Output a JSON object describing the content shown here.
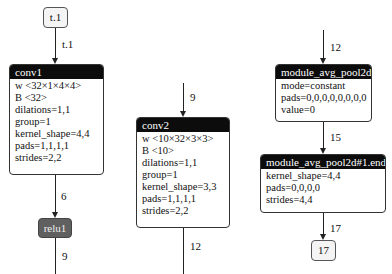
{
  "graph": {
    "inputs": [
      {
        "label": "t.1"
      }
    ],
    "outputs": [
      {
        "label": "17"
      }
    ],
    "edges": {
      "input_to_conv1": "t.1",
      "conv1_to_relu1": "6",
      "relu1_out": "9",
      "to_conv2": "9",
      "conv2_out": "12",
      "to_pad": "12",
      "pad_to_avgpool": "15",
      "avgpool_to_output": "17"
    },
    "nodes": {
      "conv1": {
        "title": "conv1",
        "attrs": [
          "w <32×1×4×4>",
          "B <32>",
          "dilations=1,1",
          "group=1",
          "kernel_shape=4,4",
          "pads=1,1,1,1",
          "strides=2,2"
        ]
      },
      "relu1": {
        "title": "relu1"
      },
      "conv2": {
        "title": "conv2",
        "attrs": [
          "w <10×32×3×3>",
          "B <10>",
          "dilations=1,1",
          "group=1",
          "kernel_shape=3,3",
          "pads=1,1,1,1",
          "strides=2,2"
        ]
      },
      "pad": {
        "title": "module_avg_pool2d",
        "attrs": [
          "mode=constant",
          "pads=0,0,0,0,0,0,0,0",
          "value=0"
        ]
      },
      "avgpool": {
        "title": "module_avg_pool2d#1.end",
        "attrs": [
          "kernel_shape=4,4",
          "pads=0,0,0,0",
          "strides=4,4"
        ]
      }
    }
  }
}
